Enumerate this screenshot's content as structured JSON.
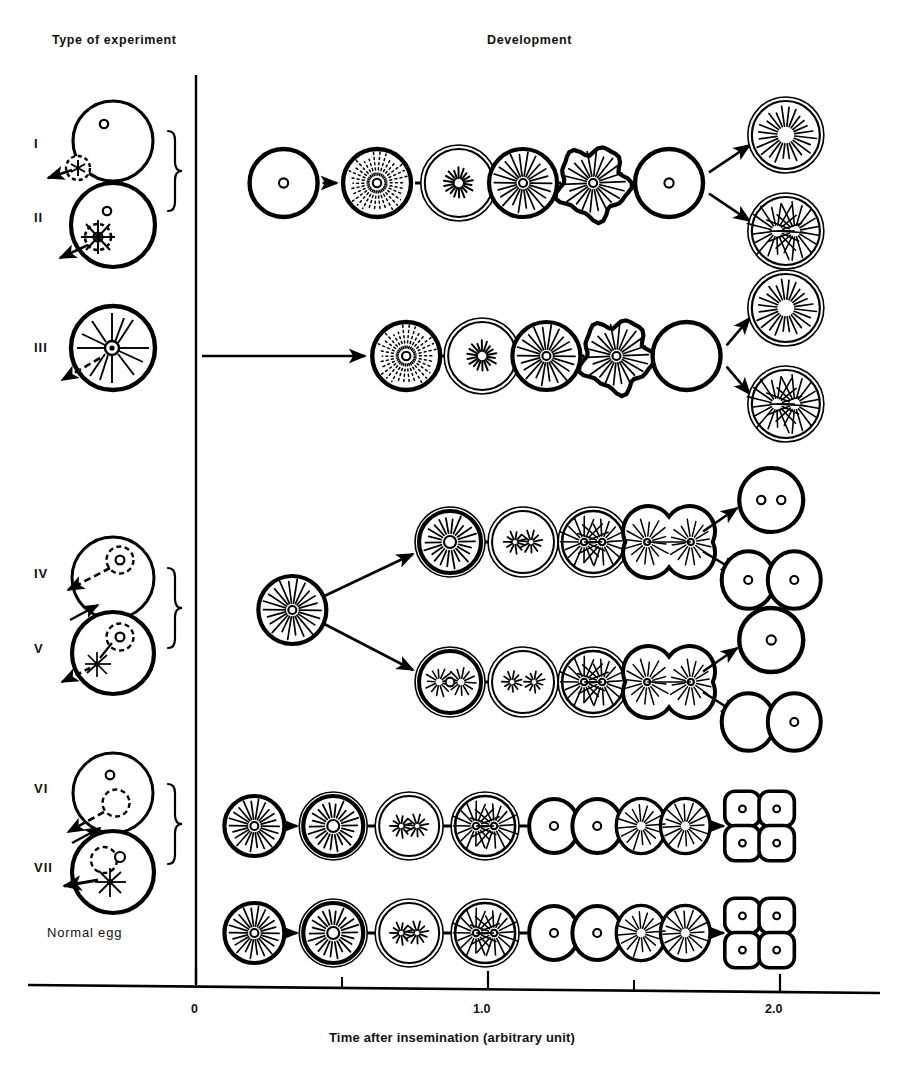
{
  "figure": {
    "title_left": "Type of experiment",
    "title_right": "Development",
    "background_color": "#ffffff",
    "ink_color": "#000000"
  },
  "headers": {
    "type_of_experiment": "Type of experiment",
    "development": "Development"
  },
  "row_labels": [
    {
      "id": "row-1",
      "label": "I"
    },
    {
      "id": "row-2",
      "label": "II"
    },
    {
      "id": "row-3",
      "label": "III"
    },
    {
      "id": "row-4",
      "label": "IV"
    },
    {
      "id": "row-5",
      "label": "V"
    },
    {
      "id": "row-6",
      "label": "VI"
    },
    {
      "id": "row-7",
      "label": "VII"
    },
    {
      "id": "row-8",
      "label": "Normal egg"
    }
  ],
  "axis": {
    "caption": "Time after insemination (arbitrary unit)",
    "ticks": [
      {
        "value": "0",
        "x": 196
      },
      {
        "value": "1.0",
        "x": 488
      },
      {
        "value": "2.0",
        "x": 780
      }
    ],
    "minor_ticks": [
      0.5,
      1.5
    ],
    "range": [
      0,
      2.3
    ],
    "origin_x": 196,
    "unit_px": 292
  },
  "chart_data": {
    "type": "diagram",
    "xlabel": "Time after insemination (arbitrary unit)",
    "ylabel": "",
    "xlim": [
      0,
      2.3
    ],
    "grid": false,
    "legend": "none",
    "row_groups": [
      {
        "name": "group-I-II",
        "experiments": [
          "I",
          "II"
        ],
        "brace": true,
        "stages": [
          {
            "t": 0.3,
            "kind": "egg-nucleus"
          },
          {
            "t": 0.62,
            "kind": "egg-dotted-aster"
          },
          {
            "t": 0.9,
            "kind": "egg-small-aster"
          },
          {
            "t": 1.12,
            "kind": "egg-large-aster"
          },
          {
            "t": 1.36,
            "kind": "egg-lobed-aster"
          },
          {
            "t": 1.62,
            "kind": "egg-nucleus-plain"
          }
        ],
        "outcomes": [
          {
            "t": 2.02,
            "dy": -48,
            "kind": "egg-large-aster-double"
          },
          {
            "t": 2.02,
            "dy": 48,
            "kind": "egg-twin-aster-double"
          }
        ],
        "connectors": [
          "arrow",
          "line",
          "line",
          "line",
          "line",
          "branch"
        ]
      },
      {
        "name": "group-III",
        "experiments": [
          "III"
        ],
        "brace": false,
        "stages": [
          {
            "t": 0.72,
            "kind": "egg-dotted-aster"
          },
          {
            "t": 0.98,
            "kind": "egg-small-aster"
          },
          {
            "t": 1.2,
            "kind": "egg-large-aster"
          },
          {
            "t": 1.44,
            "kind": "egg-lobed-aster"
          },
          {
            "t": 1.68,
            "kind": "egg-empty"
          }
        ],
        "outcomes": [
          {
            "t": 2.02,
            "dy": -48,
            "kind": "egg-large-aster-double"
          },
          {
            "t": 2.02,
            "dy": 48,
            "kind": "egg-twin-aster-double"
          }
        ],
        "connectors": [
          "long-arrow",
          "line",
          "line",
          "line",
          "branch"
        ]
      },
      {
        "name": "group-IV-V",
        "experiments": [
          "IV",
          "V"
        ],
        "brace": true,
        "shared_start": {
          "t": 0.33,
          "kind": "egg-large-aster"
        },
        "tracks": [
          {
            "name": "track-IV",
            "dy": -68,
            "stages": [
              {
                "t": 0.87,
                "kind": "egg-aster-nucleus"
              },
              {
                "t": 1.12,
                "kind": "egg-metaphase"
              },
              {
                "t": 1.36,
                "kind": "egg-twin-aster"
              },
              {
                "t": 1.62,
                "kind": "cell-cleaving-asters"
              }
            ],
            "outcomes": [
              {
                "t": 1.97,
                "dy": -42,
                "kind": "egg-binucleate"
              },
              {
                "t": 1.97,
                "dy": 38,
                "kind": "two-cell"
              }
            ]
          },
          {
            "name": "track-V",
            "dy": 72,
            "stages": [
              {
                "t": 0.87,
                "kind": "egg-twin-small-aster"
              },
              {
                "t": 1.12,
                "kind": "egg-two-small-asters"
              },
              {
                "t": 1.36,
                "kind": "egg-twin-aster"
              },
              {
                "t": 1.62,
                "kind": "cell-cleaving-asters"
              }
            ],
            "outcomes": [
              {
                "t": 1.97,
                "dy": -42,
                "kind": "egg-nucleus-plain"
              },
              {
                "t": 1.97,
                "dy": 40,
                "kind": "two-cell-one-nucleus"
              }
            ]
          }
        ]
      },
      {
        "name": "group-VI-VII",
        "experiments": [
          "VI",
          "VII"
        ],
        "brace": true,
        "stages": [
          {
            "t": 0.2,
            "kind": "egg-large-aster"
          },
          {
            "t": 0.47,
            "kind": "egg-aster-nucleus"
          },
          {
            "t": 0.73,
            "kind": "egg-metaphase"
          },
          {
            "t": 0.99,
            "kind": "egg-twin-aster"
          },
          {
            "t": 1.3,
            "kind": "two-cell"
          },
          {
            "t": 1.6,
            "kind": "two-cell-asters"
          },
          {
            "t": 1.93,
            "kind": "four-cell"
          }
        ],
        "connectors": [
          "arrow",
          "line",
          "line",
          "line",
          "line",
          "arrow"
        ]
      },
      {
        "name": "group-normal",
        "experiments": [
          "Normal egg"
        ],
        "brace": false,
        "stages": [
          {
            "t": 0.2,
            "kind": "egg-large-aster"
          },
          {
            "t": 0.47,
            "kind": "egg-aster-nucleus"
          },
          {
            "t": 0.73,
            "kind": "egg-metaphase"
          },
          {
            "t": 0.99,
            "kind": "egg-twin-aster"
          },
          {
            "t": 1.3,
            "kind": "two-cell"
          },
          {
            "t": 1.6,
            "kind": "two-cell-asters"
          },
          {
            "t": 1.93,
            "kind": "four-cell"
          }
        ],
        "connectors": [
          "arrow",
          "line",
          "line",
          "line",
          "line",
          "arrow"
        ]
      }
    ],
    "experiment_icons": [
      {
        "experiment": "I",
        "description": "sperm attached at egg surface, not entered; egg nucleus present"
      },
      {
        "experiment": "II",
        "description": "sperm inside egg forming sperm aster; egg nucleus present"
      },
      {
        "experiment": "III",
        "description": "sperm inside egg with large sperm aster; no egg nucleus"
      },
      {
        "experiment": "IV",
        "description": "egg nucleus enclosed, sperm entering, second arrow"
      },
      {
        "experiment": "V",
        "description": "egg nucleus enclosed, sperm aster inside cytoplasm"
      },
      {
        "experiment": "VI",
        "description": "egg nucleus plus dashed vacuole, sperm entering"
      },
      {
        "experiment": "VII",
        "description": "egg nucleus with sperm aster at periphery"
      }
    ]
  }
}
